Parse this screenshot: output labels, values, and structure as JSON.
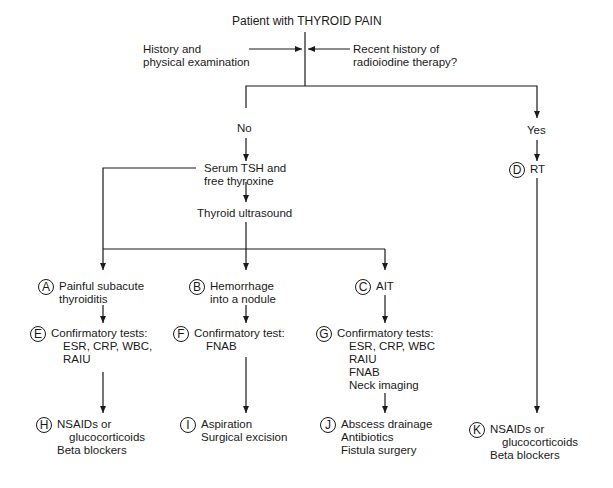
{
  "title": "Patient with THYROID PAIN",
  "inputs": {
    "left": [
      "History and",
      "physical examination"
    ],
    "right": [
      "Recent history of",
      "radioiodine therapy?"
    ]
  },
  "branches": {
    "no": "No",
    "yes": "Yes"
  },
  "steps": {
    "serum": [
      "Serum TSH and",
      "free thyroxine"
    ],
    "ultrasound": "Thyroid ultrasound"
  },
  "nodes": {
    "A": {
      "letter": "A",
      "lines": [
        "Painful subacute",
        "thyroiditis"
      ]
    },
    "B": {
      "letter": "B",
      "lines": [
        "Hemorrhage",
        "into a nodule"
      ]
    },
    "C": {
      "letter": "C",
      "lines": [
        "AIT"
      ]
    },
    "D": {
      "letter": "D",
      "lines": [
        "RT"
      ]
    },
    "E": {
      "letter": "E",
      "lines": [
        "Confirmatory tests:",
        "ESR, CRP, WBC,",
        "RAIU"
      ]
    },
    "F": {
      "letter": "F",
      "lines": [
        "Confirmatory test:",
        "FNAB"
      ]
    },
    "G": {
      "letter": "G",
      "lines": [
        "Confirmatory tests:",
        "ESR, CRP, WBC",
        "RAIU",
        "FNAB",
        "Neck imaging"
      ]
    },
    "H": {
      "letter": "H",
      "lines": [
        "NSAIDs or",
        "glucocorticoids",
        "Beta blockers"
      ]
    },
    "I": {
      "letter": "I",
      "lines": [
        "Aspiration",
        "Surgical excision"
      ]
    },
    "J": {
      "letter": "J",
      "lines": [
        "Abscess drainage",
        "Antibiotics",
        "Fistula surgery"
      ]
    },
    "K": {
      "letter": "K",
      "lines": [
        "NSAIDs or",
        "glucocorticoids",
        "Beta blockers"
      ]
    }
  },
  "colors": {
    "line": "#1a1a1a",
    "background": "#ffffff"
  }
}
